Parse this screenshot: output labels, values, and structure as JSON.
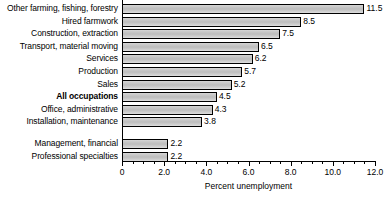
{
  "chart_data": {
    "type": "bar",
    "orientation": "horizontal",
    "title": "",
    "subtitle": "",
    "xlabel": "Percent unemployment",
    "ylabel": "",
    "xlim": [
      0,
      12
    ],
    "grid": false,
    "legend": null,
    "major_tick_step": 2.0,
    "minor_tick_step": 0.5,
    "xticks": [
      "0",
      "2.0",
      "4.0",
      "6.0",
      "8.0",
      "10.0",
      "12.0"
    ],
    "xtick_values": [
      0,
      2,
      4,
      6,
      8,
      10,
      12
    ],
    "categories": [
      "Other farming, fishing, forestry",
      "Hired farmwork",
      "Construction, extraction",
      "Transport, material moving",
      "Services",
      "Production",
      "Sales",
      "All occupations",
      "Office, administrative",
      "Installation, maintenance",
      "Management, financial",
      "Professional specialties"
    ],
    "values": [
      11.5,
      8.5,
      7.5,
      6.5,
      6.2,
      5.7,
      5.2,
      4.5,
      4.3,
      3.8,
      2.2,
      2.2
    ],
    "data_labels": [
      "11.5",
      "8.5",
      "7.5",
      "6.5",
      "6.2",
      "5.7",
      "5.2",
      "4.5",
      "4.3",
      "3.8",
      "2.2",
      "2.2"
    ],
    "highlight_category": "All occupations",
    "bar_color": "#c9c9c9",
    "bar_edge_color": "#000000",
    "background_color": "#ffffff",
    "text_color": "#000000"
  }
}
